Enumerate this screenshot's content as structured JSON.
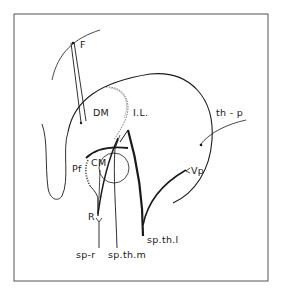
{
  "diagram": {
    "type": "anatomical-pathway-schematic",
    "colors": {
      "ink": "#1a1a1a",
      "frame": "#555555",
      "background": "#ffffff"
    },
    "labels": {
      "F": "F",
      "DM": "DM",
      "IL": "I.L.",
      "th_p": "th - p",
      "Pf": "Pf",
      "CM": "CM",
      "Vp": "Vp",
      "R": "R",
      "sp_r": "sp-r",
      "sp_th_m": "sp.th.m",
      "sp_th_l": "sp.th.l"
    }
  }
}
